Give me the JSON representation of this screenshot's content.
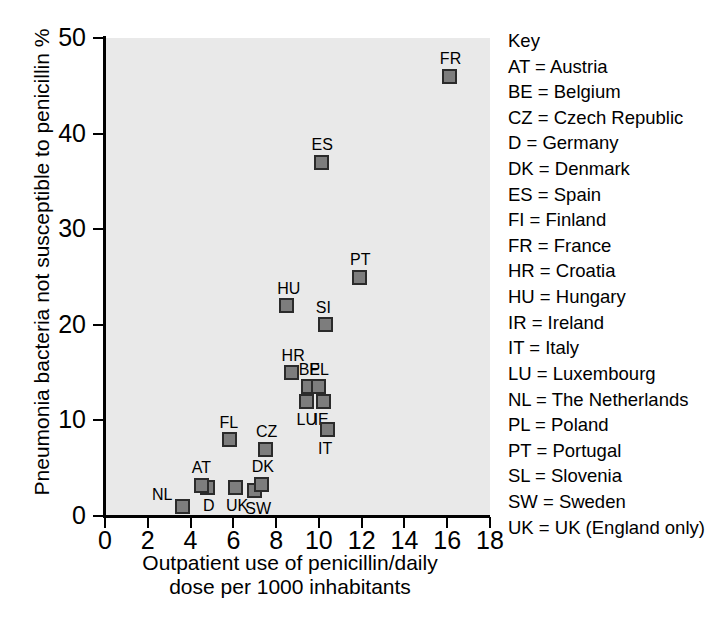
{
  "chart_data": {
    "type": "scatter",
    "title": "",
    "xlabel": "Outpatient use of penicillin/daily dose per 1000 inhabitants",
    "xlabel_line1": "Outpatient use of penicillin/daily",
    "xlabel_line2": "dose per 1000 inhabitants",
    "ylabel": "Pneumonia bacteria not susceptible to penicillin %",
    "xlim": [
      0,
      18
    ],
    "ylim": [
      0,
      50
    ],
    "xticks": [
      0,
      2,
      4,
      6,
      8,
      10,
      12,
      14,
      16,
      18
    ],
    "yticks": [
      0,
      10,
      20,
      30,
      40,
      50
    ],
    "grid": false,
    "legend_position": "right",
    "marker_color": "#7d7d7d",
    "marker_edge_color": "#2b2b2b",
    "plot_background": "#e9e9e9",
    "points": [
      {
        "label": "NL",
        "x": 3.6,
        "y": 1.0,
        "label_pos": "left"
      },
      {
        "label": "D",
        "x": 4.8,
        "y": 3.0,
        "label_pos": "below"
      },
      {
        "label": "AT",
        "x": 4.5,
        "y": 3.2,
        "label_pos": "above"
      },
      {
        "label": "UK",
        "x": 6.1,
        "y": 3.0,
        "label_pos": "below"
      },
      {
        "label": "SW",
        "x": 7.0,
        "y": 2.7,
        "label_pos": "below"
      },
      {
        "label": "DK",
        "x": 7.3,
        "y": 3.3,
        "label_pos": "above"
      },
      {
        "label": "FL",
        "x": 5.8,
        "y": 8.0,
        "label_pos": "above"
      },
      {
        "label": "CZ",
        "x": 7.5,
        "y": 7.0,
        "label_pos": "above"
      },
      {
        "label": "HR",
        "x": 8.7,
        "y": 15.0,
        "label_pos": "above"
      },
      {
        "label": "BE",
        "x": 9.5,
        "y": 13.5,
        "label_pos": "above"
      },
      {
        "label": "PL",
        "x": 10.0,
        "y": 13.5,
        "label_pos": "above"
      },
      {
        "label": "LU",
        "x": 9.4,
        "y": 12.0,
        "label_pos": "below"
      },
      {
        "label": "IE",
        "x": 10.2,
        "y": 12.0,
        "label_pos": "below"
      },
      {
        "label": "IT",
        "x": 10.4,
        "y": 9.0,
        "label_pos": "below"
      },
      {
        "label": "HU",
        "x": 8.5,
        "y": 22.0,
        "label_pos": "above"
      },
      {
        "label": "SI",
        "x": 10.3,
        "y": 20.0,
        "label_pos": "above"
      },
      {
        "label": "PT",
        "x": 11.9,
        "y": 25.0,
        "label_pos": "above"
      },
      {
        "label": "ES",
        "x": 10.1,
        "y": 37.0,
        "label_pos": "above"
      },
      {
        "label": "FR",
        "x": 16.1,
        "y": 46.0,
        "label_pos": "above"
      }
    ]
  },
  "key": {
    "title": "Key",
    "entries": [
      "AT = Austria",
      "BE = Belgium",
      "CZ = Czech Republic",
      "D = Germany",
      "DK = Denmark",
      "ES = Spain",
      "FI = Finland",
      "FR = France",
      "HR = Croatia",
      "HU = Hungary",
      "IR = Ireland",
      "IT = Italy",
      "LU = Luxembourg",
      "NL = The Netherlands",
      "PL = Poland",
      "PT = Portugal",
      "SL = Slovenia",
      "SW = Sweden",
      "UK = UK (England only)"
    ]
  }
}
